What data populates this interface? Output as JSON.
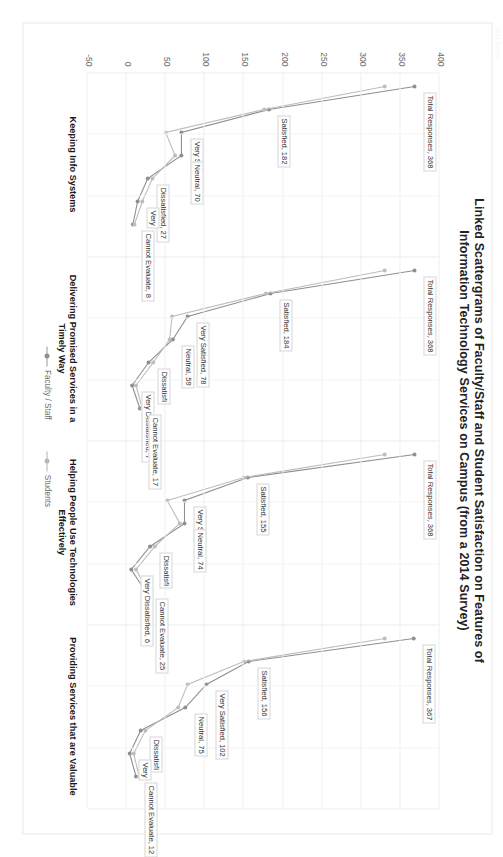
{
  "meta": {
    "corner_stamp": "2014 Survey"
  },
  "title": {
    "line1": "Linked Scattergrams of Faculty/Staff and Student Satisfaction on Features of",
    "line2": "Information Technology Services on Campus (from a 2014 Survey)"
  },
  "legend": {
    "items": [
      {
        "label": "Faculty / Staff",
        "color": "#9a9a9a"
      },
      {
        "label": "Students",
        "color": "#b2b2b2"
      }
    ]
  },
  "chart_data": {
    "type": "line",
    "title": "Linked Scattergrams of Faculty/Staff and Student Satisfaction on Features of Information Technology Services on Campus (from a 2014 Survey)",
    "xlabel": "",
    "ylabel": "",
    "ylim": [
      -50,
      400
    ],
    "yticks": [
      "400",
      "350",
      "300",
      "250",
      "200",
      "150",
      "100",
      "50",
      "0",
      "-50"
    ],
    "grid": true,
    "legend_position": "bottom",
    "categories": [
      "Total Responses",
      "Satisfied",
      "Very Satisfied",
      "Neutral",
      "Dissatisfied",
      "Very Dissatisfied",
      "Cannot Evaluate"
    ],
    "panels": [
      {
        "name": "Keeping Info Systems",
        "caption_line1": "Keeping Info Systems",
        "caption_line2": "",
        "series": [
          {
            "name": "Faculty / Staff",
            "values": [
              368,
              182,
              70,
              70,
              27,
              14,
              8
            ]
          },
          {
            "name": "Students",
            "values": [
              330,
              176,
              50,
              62,
              33,
              20,
              10
            ]
          }
        ],
        "labels": [
          {
            "text": "Total Responses, 368",
            "point": "Total Responses"
          },
          {
            "text": "Satisfied, 182",
            "point": "Satisfied"
          },
          {
            "text": "Very Sati",
            "point": "Very Satisfied"
          },
          {
            "text": "Neutral, 70",
            "point": "Neutral"
          },
          {
            "text": "Dissatisfied, 27",
            "point": "Dissatisfied"
          },
          {
            "text": "Very",
            "point": "Very Dissatisfied"
          },
          {
            "text": "Cannot Evaluate, 8",
            "point": "Cannot Evaluate"
          }
        ]
      },
      {
        "name": "Delivering Promised Services in a Timely Way",
        "caption_line1": "Delivering Promised Services in a",
        "caption_line2": "Timely Way",
        "series": [
          {
            "name": "Faculty / Staff",
            "values": [
              368,
              184,
              78,
              59,
              28,
              7,
              17
            ]
          },
          {
            "name": "Students",
            "values": [
              330,
              178,
              58,
              55,
              34,
              12,
              20
            ]
          }
        ],
        "labels": [
          {
            "text": "Total Responses, 368",
            "point": "Total Responses"
          },
          {
            "text": "Satisfied, 184",
            "point": "Satisfied"
          },
          {
            "text": "Very Satisfied, 78",
            "point": "Very Satisfied"
          },
          {
            "text": "Neutral, 59",
            "point": "Neutral"
          },
          {
            "text": "Dissatisfi",
            "point": "Dissatisfied"
          },
          {
            "text": "Very Dissatisfied, 7",
            "point": "Very Dissatisfied"
          },
          {
            "text": "Cannot Evaluate, 17",
            "point": "Cannot Evaluate"
          }
        ]
      },
      {
        "name": "Helping People Use Technologies Effectively",
        "caption_line1": "Helping People Use Technologies",
        "caption_line2": "Effectively",
        "series": [
          {
            "name": "Faculty / Staff",
            "values": [
              368,
              155,
              74,
              74,
              30,
              6,
              25
            ]
          },
          {
            "name": "Students",
            "values": [
              330,
              150,
              52,
              68,
              36,
              12,
              28
            ]
          }
        ],
        "labels": [
          {
            "text": "Total Responses, 368",
            "point": "Total Responses"
          },
          {
            "text": "Satisfied, 155",
            "point": "Satisfied"
          },
          {
            "text": "Very Sati",
            "point": "Very Satisfied"
          },
          {
            "text": "Neutral, 74",
            "point": "Neutral"
          },
          {
            "text": "Dissatisfi",
            "point": "Dissatisfied"
          },
          {
            "text": "Very Dissatisfied, 6",
            "point": "Very Dissatisfied"
          },
          {
            "text": "Cannot Evaluate, 25",
            "point": "Cannot Evaluate"
          }
        ]
      },
      {
        "name": "Providing Services that are Valuable",
        "caption_line1": "Providing Services that are Valuable",
        "caption_line2": "",
        "series": [
          {
            "name": "Faculty / Staff",
            "values": [
              367,
              156,
              102,
              75,
              18,
              4,
              12
            ]
          },
          {
            "name": "Students",
            "values": [
              330,
              150,
              78,
              66,
              24,
              9,
              16
            ]
          }
        ],
        "labels": [
          {
            "text": "Total Responses, 367",
            "point": "Total Responses"
          },
          {
            "text": "Satisfied, 156",
            "point": "Satisfied"
          },
          {
            "text": "Very Satisfied, 102",
            "point": "Very Satisfied"
          },
          {
            "text": "Neutral, 75",
            "point": "Neutral"
          },
          {
            "text": "Dissatisfi",
            "point": "Dissatisfied"
          },
          {
            "text": "Very",
            "point": "Very Dissatisfied"
          },
          {
            "text": "Cannot Evaluate, 12",
            "point": "Cannot Evaluate"
          }
        ]
      }
    ]
  }
}
